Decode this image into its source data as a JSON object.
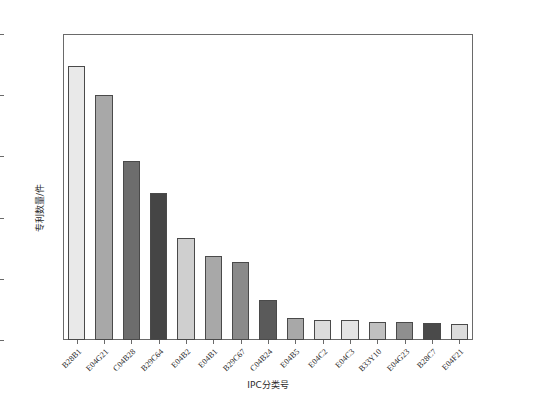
{
  "chart_data": {
    "type": "bar",
    "title": "",
    "xlabel": "IPC分类号",
    "ylabel": "专利数量/件",
    "ylim": [
      0,
      250
    ],
    "yticks": [
      0,
      50,
      100,
      150,
      200,
      250
    ],
    "grid": false,
    "legend": "none",
    "categories": [
      "B28B1",
      "E04G21",
      "C04B28",
      "B29C64",
      "E04B2",
      "E04B1",
      "B29C67",
      "C04B24",
      "E04B5",
      "E04C2",
      "E04C3",
      "B33Y10",
      "E04G23",
      "B28C7",
      "E04F21"
    ],
    "values": [
      224,
      200,
      146,
      120,
      83,
      69,
      64,
      33,
      18,
      16,
      16,
      15,
      15,
      14,
      13
    ],
    "bar_colors": [
      "#e9e9e9",
      "#a8a8a8",
      "#6d6d6d",
      "#454545",
      "#cfcfcf",
      "#a8a8a8",
      "#8a8a8a",
      "#5a5a5a",
      "#a8a8a8",
      "#dcdcdc",
      "#e4e4e4",
      "#c0c0c0",
      "#8f8f8f",
      "#4a4a4a",
      "#dcdcdc"
    ],
    "bar_edge_color": "#4a4a4a",
    "axis_color": "#6a6a6a",
    "background": "#ffffff"
  }
}
